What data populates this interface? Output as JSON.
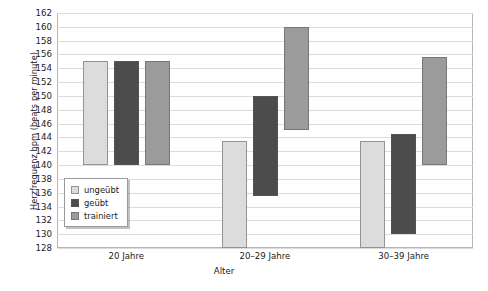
{
  "chart_data": {
    "type": "bar",
    "bar_style": "floating-range",
    "title": "",
    "subtitle": "",
    "xlabel": "Alter",
    "ylabel": "Herzfrequenz bpm (beats per minute)",
    "categories": [
      "20 Jahre",
      "20–29 Jahre",
      "30–39 Jahre"
    ],
    "ylim": [
      128,
      162
    ],
    "ytick_step": 2,
    "yticks": [
      128,
      130,
      132,
      134,
      136,
      138,
      140,
      142,
      144,
      146,
      148,
      150,
      152,
      154,
      156,
      158,
      160,
      162
    ],
    "grid": true,
    "grid_axis": "y",
    "legend_position": "inside-lower-left",
    "series": [
      {
        "name": "ungeübt",
        "color": "#dcdcdc",
        "ranges": [
          {
            "category": "20 Jahre",
            "low": 140,
            "high": 155
          },
          {
            "category": "20–29 Jahre",
            "low": 128,
            "high": 143.5
          },
          {
            "category": "30–39 Jahre",
            "low": 128,
            "high": 143.5
          }
        ]
      },
      {
        "name": "geübt",
        "color": "#4c4c4c",
        "ranges": [
          {
            "category": "20 Jahre",
            "low": 140,
            "high": 155
          },
          {
            "category": "20–29 Jahre",
            "low": 135.5,
            "high": 150
          },
          {
            "category": "30–39 Jahre",
            "low": 130,
            "high": 144.5
          }
        ]
      },
      {
        "name": "trainiert",
        "color": "#9b9b9b",
        "ranges": [
          {
            "category": "20 Jahre",
            "low": 140,
            "high": 155
          },
          {
            "category": "20–29 Jahre",
            "low": 145,
            "high": 160
          },
          {
            "category": "30–39 Jahre",
            "low": 140,
            "high": 155.7
          }
        ]
      }
    ]
  },
  "legend": {
    "items": [
      {
        "label": "ungeübt",
        "color": "#dcdcdc"
      },
      {
        "label": "geübt",
        "color": "#4c4c4c"
      },
      {
        "label": "trainiert",
        "color": "#9b9b9b"
      }
    ]
  },
  "axes": {
    "y_title": "Herzfrequenz bpm (beats per minute)",
    "x_title": "Alter"
  }
}
